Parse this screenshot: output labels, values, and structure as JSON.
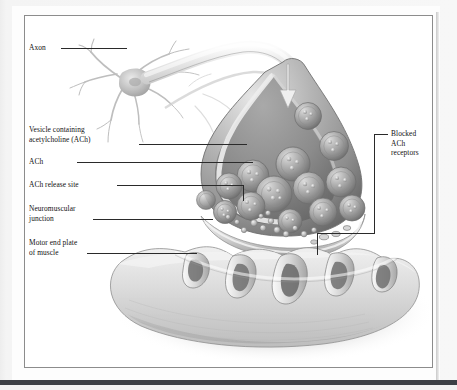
{
  "figure": {
    "type": "anatomical-illustration",
    "frame_color": "#8c8c8c",
    "page_background": "#f2f2f2",
    "plate_background": "#fdfdfd",
    "artwork_background": "#ffffff",
    "ink_color": "#2a2a2a",
    "text_color": "#111111"
  },
  "labels": {
    "axon": "Axon",
    "vesicle": "Vesicle containing\nacetylcholine (ACh)",
    "ach": "ACh",
    "release_site": "ACh release site",
    "nmj": "Neuromuscular\njunction",
    "end_plate": "Motor end plate\nof muscle",
    "blocked_receptors": "Blocked\nACh\nreceptors"
  },
  "structures": {
    "neuron_cell_body": "neuron cell body with dendrites",
    "axon_fiber": "myelinated axon curving to synaptic terminal",
    "impulse_arrow": "downward impulse arrow inside axon",
    "synaptic_bulb": "axon terminal bouton, cut-away",
    "synaptic_vesicles": "gray spheres containing ACh granules",
    "ach_molecules": "small free ACh granules in synaptic cleft",
    "junctional_folds": "post-synaptic junctional folds of sarcolemma",
    "blocked_receptor_sites": "receptor sites occupied / blocked",
    "muscle_surface": "motor end plate of muscle fiber"
  },
  "counts": {
    "vesicles_visible": 14,
    "junctional_folds_visible": 5,
    "free_ach_granules": 18
  }
}
